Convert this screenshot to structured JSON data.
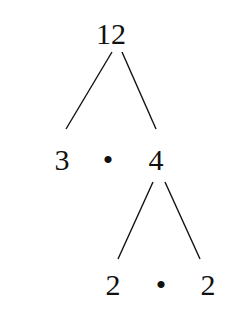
{
  "diagram": {
    "type": "factor-tree",
    "root": "12",
    "level1": {
      "left": "3",
      "operator": "•",
      "right": "4"
    },
    "level2": {
      "left": "2",
      "operator": "•",
      "right": "2"
    }
  }
}
